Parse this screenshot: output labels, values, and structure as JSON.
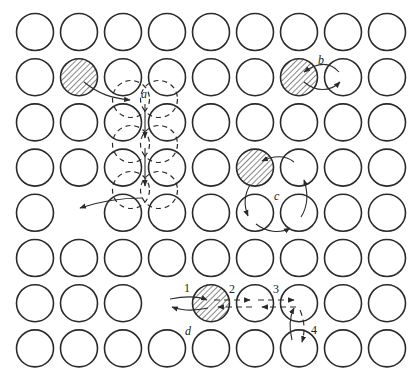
{
  "diagram": {
    "grid": {
      "columns": 9,
      "rows": 8,
      "x0": 35,
      "dx": 44,
      "y0": 32,
      "dy": 45.2,
      "radius": 18.5
    },
    "vacancies": [
      {
        "row": 4,
        "col": 1
      },
      {
        "row": 6,
        "col": 3
      }
    ],
    "hatched_atoms": [
      {
        "row": 1,
        "col": 1
      },
      {
        "row": 1,
        "col": 6
      },
      {
        "row": 3,
        "col": 5
      },
      {
        "row": 6,
        "col": 4
      }
    ],
    "mechanisms": [
      {
        "id": "a",
        "label": "a",
        "type": "interstitialcy / crowdion chain"
      },
      {
        "id": "b",
        "label": "b",
        "type": "direct exchange"
      },
      {
        "id": "c",
        "label": "c",
        "type": "ring rotation"
      },
      {
        "id": "d",
        "label": "d",
        "type": "vacancy mechanism",
        "steps": [
          "1",
          "2",
          "3",
          "4"
        ]
      }
    ]
  },
  "labels": {
    "a": "a",
    "b": "b",
    "c": "c",
    "d": "d",
    "step1": "1",
    "step2": "2",
    "step3": "3",
    "step4": "4"
  }
}
